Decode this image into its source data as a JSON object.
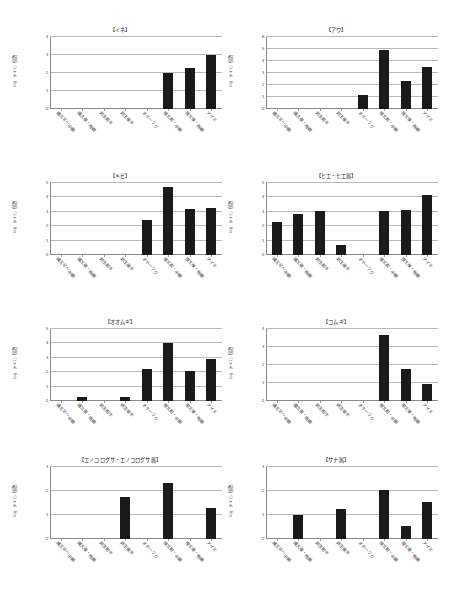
{
  "figure": {
    "background_color": "#ffffff",
    "bar_color": "#1a1a1a",
    "grid_color": "#b9b9b9",
    "axis_color": "#8a8a8a",
    "categories": [
      "縄文早～中期",
      "縄文後・晩期",
      "弥生前半",
      "弥生後半",
      "オホーツク",
      "擦文前・中期",
      "擦文後・晩期",
      "アイヌ"
    ],
    "ylabel": "log（n+1）個数"
  },
  "chart_data": [
    {
      "type": "bar",
      "title": "【イネ】",
      "categories": [
        "縄文早～中期",
        "縄文後・晩期",
        "弥生前半",
        "弥生後半",
        "オホーツク",
        "擦文前・中期",
        "擦文後・晩期",
        "アイヌ"
      ],
      "values": [
        0,
        0,
        0,
        0,
        0,
        2.0,
        2.3,
        3.0
      ],
      "xlabel": "",
      "ylabel": "log（n+1）個数",
      "ylim": [
        0,
        4
      ],
      "yticks": [
        0,
        1,
        2,
        3,
        4
      ],
      "grid": true,
      "legend": "none"
    },
    {
      "type": "bar",
      "title": "【アワ】",
      "categories": [
        "縄文早～中期",
        "縄文後・晩期",
        "弥生前半",
        "弥生後半",
        "オホーツク",
        "擦文前・中期",
        "擦文後・晩期",
        "アイヌ"
      ],
      "values": [
        0,
        0,
        0,
        0,
        1.2,
        4.9,
        2.3,
        3.5
      ],
      "xlabel": "",
      "ylabel": "log（n+1）個数",
      "ylim": [
        0,
        6
      ],
      "yticks": [
        0,
        1,
        2,
        3,
        4,
        5,
        6
      ],
      "grid": true,
      "legend": "none"
    },
    {
      "type": "bar",
      "title": "【キビ】",
      "categories": [
        "縄文早～中期",
        "縄文後・晩期",
        "弥生前半",
        "弥生後半",
        "オホーツク",
        "擦文前・中期",
        "擦文後・晩期",
        "アイヌ"
      ],
      "values": [
        0,
        0,
        0,
        0,
        2.4,
        4.7,
        3.2,
        3.25
      ],
      "xlabel": "",
      "ylabel": "log（n+1）個数",
      "ylim": [
        0,
        5
      ],
      "yticks": [
        0,
        1,
        2,
        3,
        4,
        5
      ],
      "grid": true,
      "legend": "none"
    },
    {
      "type": "bar",
      "title": "【ヒエ・ヒエ属】",
      "categories": [
        "縄文早～中期",
        "縄文後・晩期",
        "弥生前半",
        "弥生後半",
        "オホーツク",
        "擦文前・中期",
        "擦文後・晩期",
        "アイヌ"
      ],
      "values": [
        2.3,
        2.85,
        3.05,
        0.7,
        0,
        3.05,
        3.1,
        4.2
      ],
      "xlabel": "",
      "ylabel": "log（n+1）個数",
      "ylim": [
        0,
        5
      ],
      "yticks": [
        0,
        1,
        2,
        3,
        4,
        5
      ],
      "grid": true,
      "legend": "none"
    },
    {
      "type": "bar",
      "title": "【オオムギ】",
      "categories": [
        "縄文早～中期",
        "縄文後・晩期",
        "弥生前半",
        "弥生後半",
        "オホーツク",
        "擦文前・中期",
        "擦文後・晩期",
        "アイヌ"
      ],
      "values": [
        0,
        0.25,
        0,
        0.25,
        2.2,
        4.05,
        2.1,
        2.95
      ],
      "xlabel": "",
      "ylabel": "log（n+1）個数",
      "ylim": [
        0,
        5
      ],
      "yticks": [
        0,
        1,
        2,
        3,
        4,
        5
      ],
      "grid": true,
      "legend": "none"
    },
    {
      "type": "bar",
      "title": "【コムギ】",
      "categories": [
        "縄文早～中期",
        "縄文後・晩期",
        "弥生前半",
        "弥生後半",
        "オホーツク",
        "擦文前・中期",
        "擦文後・晩期",
        "アイヌ"
      ],
      "values": [
        0,
        0,
        0,
        0,
        0,
        3.65,
        1.8,
        0.95
      ],
      "xlabel": "",
      "ylabel": "log（n+1）個数",
      "ylim": [
        0,
        4
      ],
      "yticks": [
        0,
        1,
        2,
        3,
        4
      ],
      "grid": true,
      "legend": "none"
    },
    {
      "type": "bar",
      "title": "【エノコログサ・エノコログサ属】",
      "categories": [
        "縄文早～中期",
        "縄文後・晩期",
        "弥生前半",
        "弥生後半",
        "オホーツク",
        "擦文前・中期",
        "擦文後・晩期",
        "アイヌ"
      ],
      "values": [
        0,
        0,
        0,
        1.75,
        0,
        2.35,
        0,
        1.3
      ],
      "xlabel": "",
      "ylabel": "log（n+1）個数",
      "ylim": [
        0,
        3
      ],
      "yticks": [
        0,
        1,
        2,
        3
      ],
      "grid": true,
      "legend": "none"
    },
    {
      "type": "bar",
      "title": "【サナ属】",
      "categories": [
        "縄文早～中期",
        "縄文後・晩期",
        "弥生前半",
        "弥生後半",
        "オホーツク",
        "擦文前・中期",
        "擦文後・晩期",
        "アイヌ"
      ],
      "values": [
        0,
        1.0,
        0,
        1.25,
        0,
        2.05,
        0.55,
        1.55
      ],
      "xlabel": "",
      "ylabel": "log（n+1）個数",
      "ylim": [
        0,
        3
      ],
      "yticks": [
        0,
        1,
        2,
        3
      ],
      "grid": true,
      "legend": "none"
    }
  ]
}
